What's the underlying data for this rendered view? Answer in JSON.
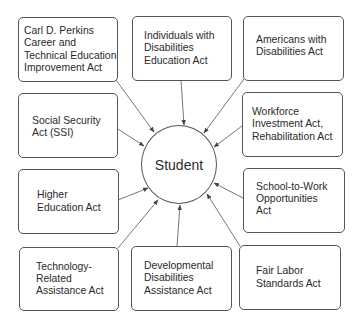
{
  "diagram": {
    "center": {
      "label": "Student"
    },
    "nodes": [
      {
        "id": "perkins",
        "label": "Carl D. Perkins\nCareer and\nTechnical Education\nImprovement Act"
      },
      {
        "id": "idea",
        "label": "Individuals with\nDisabilities\nEducation Act"
      },
      {
        "id": "ada",
        "label": "Americans with\nDisabilities Act"
      },
      {
        "id": "ssi",
        "label": "Social Security\nAct (SSI)"
      },
      {
        "id": "wia",
        "label": "Workforce\nInvestment Act,\nRehabilitation Act"
      },
      {
        "id": "hea",
        "label": "Higher\nEducation Act"
      },
      {
        "id": "stw",
        "label": "School-to-Work\nOpportunities\nAct"
      },
      {
        "id": "tech",
        "label": "Technology-\nRelated\nAssistance Act"
      },
      {
        "id": "dd",
        "label": "Developmental\nDisabilities\nAssistance Act"
      },
      {
        "id": "flsa",
        "label": "Fair Labor\nStandards Act"
      }
    ],
    "edges": [
      {
        "from": "perkins",
        "to": "center"
      },
      {
        "from": "idea",
        "to": "center"
      },
      {
        "from": "ada",
        "to": "center"
      },
      {
        "from": "ssi",
        "to": "center"
      },
      {
        "from": "wia",
        "to": "center"
      },
      {
        "from": "hea",
        "to": "center"
      },
      {
        "from": "stw",
        "to": "center"
      },
      {
        "from": "tech",
        "to": "center"
      },
      {
        "from": "dd",
        "to": "center"
      },
      {
        "from": "flsa",
        "to": "center"
      }
    ]
  }
}
